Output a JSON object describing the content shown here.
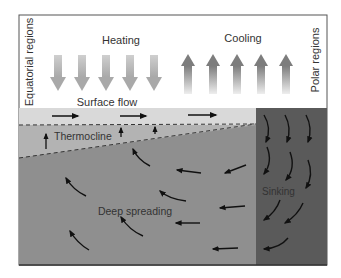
{
  "diagram": {
    "labels": {
      "left_side": "Equatorial regions",
      "right_side": "Polar regions",
      "heating": "Heating",
      "cooling": "Cooling",
      "surface_flow": "Surface flow",
      "thermocline": "Thermocline",
      "sinking": "Sinking",
      "deep_spreading": "Deep spreading"
    },
    "colors": {
      "background": "#ffffff",
      "frame": "#555555",
      "surface_layer": "#d9d9d9",
      "thermocline_layer": "#b3b3b3",
      "deep_layer": "#8f8f8f",
      "polar_column": "#5a5a5a",
      "heating_arrow": "#bdbdbd",
      "cooling_arrow": "#8a8a8a",
      "flow_arrow": "#111111"
    },
    "heating_arrow_count": 5,
    "cooling_arrow_count": 5
  }
}
